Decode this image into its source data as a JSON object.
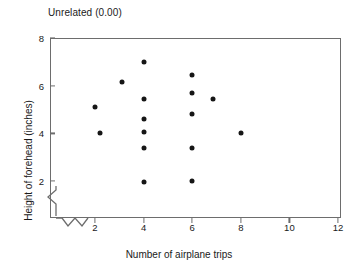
{
  "chart_data": {
    "type": "scatter",
    "title": "Unrelated (0.00)",
    "xlabel": "Number of airplane trips",
    "ylabel": "Height of forehead (inches)",
    "xlim": [
      1,
      12
    ],
    "ylim": [
      1.55,
      8
    ],
    "xticks": [
      2,
      4,
      6,
      8,
      10,
      12
    ],
    "yticks": [
      2,
      4,
      6,
      8
    ],
    "xtick_labels": [
      "2",
      "4",
      "6",
      "8",
      "10",
      "12"
    ],
    "ytick_labels": [
      "2",
      "4",
      "6",
      "8"
    ],
    "grid": false,
    "legend": null,
    "axis_break_x": true,
    "axis_break_y": true,
    "marker": "filled-circle",
    "marker_color": "#161616",
    "points": [
      {
        "x": 2.0,
        "y": 5.1
      },
      {
        "x": 2.2,
        "y": 4.0
      },
      {
        "x": 3.1,
        "y": 6.15
      },
      {
        "x": 4.0,
        "y": 7.0
      },
      {
        "x": 4.0,
        "y": 5.45
      },
      {
        "x": 4.0,
        "y": 4.6
      },
      {
        "x": 4.0,
        "y": 4.05
      },
      {
        "x": 4.0,
        "y": 3.4
      },
      {
        "x": 4.0,
        "y": 1.95
      },
      {
        "x": 6.0,
        "y": 6.45
      },
      {
        "x": 6.0,
        "y": 5.7
      },
      {
        "x": 6.0,
        "y": 4.8
      },
      {
        "x": 6.0,
        "y": 3.4
      },
      {
        "x": 6.0,
        "y": 2.0
      },
      {
        "x": 6.85,
        "y": 5.45
      },
      {
        "x": 8.0,
        "y": 4.0
      }
    ]
  },
  "colors": {
    "axis": "#6d6d6d",
    "marker": "#161616",
    "text": "#1a1a1a",
    "background": "#ffffff"
  }
}
